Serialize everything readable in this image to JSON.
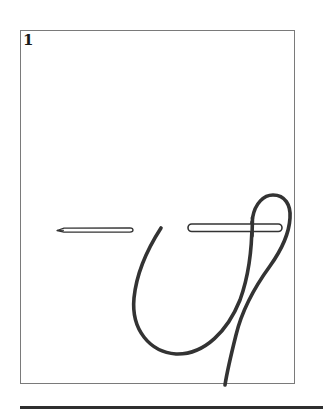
{
  "figure": {
    "step_number": "1",
    "elements": [
      {
        "name": "needle",
        "description": "pointed needle, tip facing left"
      },
      {
        "name": "rod",
        "description": "horizontal rod with rounded ends"
      },
      {
        "name": "cord",
        "description": "cord looping over rod forming a U-shaped bight"
      }
    ]
  },
  "colors": {
    "stroke": "#333333",
    "frame_border": "#7a7a7a",
    "background": "#ffffff"
  }
}
